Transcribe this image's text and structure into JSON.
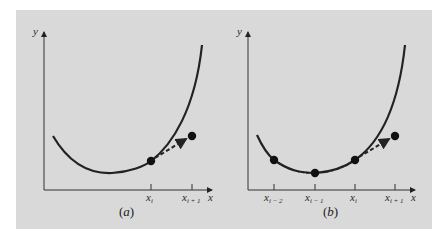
{
  "figure": {
    "background": "#d9d9d9",
    "curve_color": "#222222",
    "panels": [
      {
        "id": "a",
        "caption": "(a)",
        "caption_letter": "a",
        "axis_labels": {
          "x": "x",
          "y": "y"
        },
        "ticks": [
          {
            "base": "x",
            "sub": "i"
          },
          {
            "base": "x",
            "sub": "i + 1"
          }
        ],
        "points_on_curve": [
          "x_i"
        ],
        "extrapolated_point": "x_{i+1}",
        "description": "Single point at x_i with dashed tangent-like extrapolation arrow to x_{i+1}"
      },
      {
        "id": "b",
        "caption": "(b)",
        "caption_letter": "b",
        "axis_labels": {
          "x": "x",
          "y": "y"
        },
        "ticks": [
          {
            "base": "x",
            "sub": "i − 2"
          },
          {
            "base": "x",
            "sub": "i − 1"
          },
          {
            "base": "x",
            "sub": "i"
          },
          {
            "base": "x",
            "sub": "i + 1"
          }
        ],
        "points_on_curve": [
          "x_{i-2}",
          "x_{i-1}",
          "x_i"
        ],
        "extrapolated_point": "x_{i+1}",
        "description": "Multiple previous points fitted with dashed curve, extrapolated to x_{i+1}"
      }
    ]
  }
}
